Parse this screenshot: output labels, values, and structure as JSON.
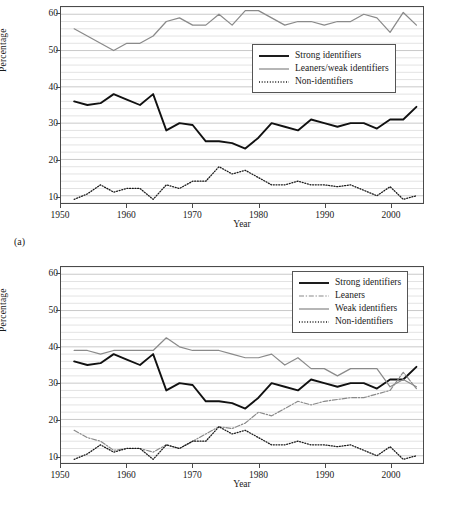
{
  "figure": {
    "panel_a_tag": "(a)",
    "panel_b_tag": "(b)"
  },
  "chart_data": [
    {
      "id": "panel-a",
      "type": "line",
      "title": "",
      "xlabel": "Year",
      "ylabel": "Percentage",
      "xlim": [
        1950,
        2005
      ],
      "ylim": [
        8,
        62
      ],
      "xticks": [
        1950,
        1960,
        1970,
        1980,
        1990,
        2000
      ],
      "xticklabels": [
        "1950",
        "1960",
        "1970",
        "1980",
        "1990",
        "2000"
      ],
      "yticks": [
        10,
        20,
        30,
        40,
        50,
        60
      ],
      "yticklabels": [
        "10",
        "20",
        "30",
        "40",
        "50",
        "60"
      ],
      "grid": "horizontal gridlines every 2 percentage points",
      "legend_position": "upper right inside axes",
      "x": [
        1952,
        1954,
        1956,
        1958,
        1960,
        1962,
        1964,
        1966,
        1968,
        1970,
        1972,
        1974,
        1976,
        1978,
        1980,
        1982,
        1984,
        1986,
        1988,
        1990,
        1992,
        1994,
        1996,
        1998,
        2000,
        2002,
        2004
      ],
      "series": [
        {
          "name": "Strong identifiers",
          "style": "solid-thick-black",
          "color": "#111111",
          "values": [
            36,
            35,
            35.5,
            38,
            36.5,
            35,
            38,
            28,
            30,
            29.5,
            25,
            25,
            24.5,
            23,
            26,
            30,
            29,
            28,
            31,
            30,
            29,
            30,
            30,
            28.5,
            31,
            31,
            34.5
          ]
        },
        {
          "name": "Leaners/weak identifiers",
          "style": "solid-gray",
          "color": "#8a8a8a",
          "values": [
            56,
            54,
            52,
            50,
            52,
            52,
            54,
            58,
            59,
            57,
            57,
            60,
            57,
            61,
            61,
            59,
            57,
            58,
            58,
            57,
            58,
            58,
            60,
            59,
            55,
            60.5,
            57
          ]
        },
        {
          "name": "Non-identifiers",
          "style": "dotted-black",
          "color": "#1a1a1a",
          "values": [
            9,
            10.5,
            13,
            11,
            12,
            12,
            9,
            13,
            12,
            14,
            14,
            18,
            16,
            17,
            15,
            13,
            13,
            14,
            13,
            13,
            12.5,
            13,
            11.5,
            10,
            12.5,
            9,
            10
          ]
        }
      ]
    },
    {
      "id": "panel-b",
      "type": "line",
      "title": "",
      "xlabel": "Year",
      "ylabel": "Percentage",
      "xlim": [
        1950,
        2005
      ],
      "ylim": [
        8,
        62
      ],
      "xticks": [
        1950,
        1960,
        1970,
        1980,
        1990,
        2000
      ],
      "xticklabels": [
        "1950",
        "1960",
        "1970",
        "1980",
        "1990",
        "2000"
      ],
      "yticks": [
        10,
        20,
        30,
        40,
        50,
        60
      ],
      "yticklabels": [
        "10",
        "20",
        "30",
        "40",
        "50",
        "60"
      ],
      "grid": "horizontal gridlines every 2 percentage points",
      "legend_position": "upper right inside axes",
      "x": [
        1952,
        1954,
        1956,
        1958,
        1960,
        1962,
        1964,
        1966,
        1968,
        1970,
        1972,
        1974,
        1976,
        1978,
        1980,
        1982,
        1984,
        1986,
        1988,
        1990,
        1992,
        1994,
        1996,
        1998,
        2000,
        2002,
        2004
      ],
      "series": [
        {
          "name": "Strong identifiers",
          "style": "solid-thick-black",
          "color": "#111111",
          "values": [
            36,
            35,
            35.5,
            38,
            36.5,
            35,
            38,
            28,
            30,
            29.5,
            25,
            25,
            24.5,
            23,
            26,
            30,
            29,
            28,
            31,
            30,
            29,
            30,
            30,
            28.5,
            31,
            31,
            34.5
          ]
        },
        {
          "name": "Leaners",
          "style": "dash-dot-gray",
          "color": "#8a8a8a",
          "values": [
            17,
            15,
            14,
            11.5,
            12,
            12,
            11,
            13,
            12,
            14,
            16,
            18,
            17.5,
            19,
            22,
            21,
            23,
            25,
            24,
            25,
            25.5,
            26,
            26,
            27,
            28,
            33,
            28.5
          ]
        },
        {
          "name": "Weak identifiers",
          "style": "solid-gray",
          "color": "#8a8a8a",
          "values": [
            39,
            39,
            38,
            39,
            39,
            39,
            39,
            42.5,
            40,
            39,
            39,
            39,
            38,
            37,
            37,
            38,
            35,
            37,
            34,
            34,
            32,
            34,
            34,
            34,
            29,
            31,
            29
          ]
        },
        {
          "name": "Non-identifiers",
          "style": "dotted-black",
          "color": "#1a1a1a",
          "values": [
            9,
            10.5,
            13,
            11,
            12,
            12,
            9,
            13,
            12,
            14,
            14,
            18,
            16,
            17,
            15,
            13,
            13,
            14,
            13,
            13,
            12.5,
            13,
            11.5,
            10,
            12.5,
            9,
            10
          ]
        }
      ]
    }
  ]
}
